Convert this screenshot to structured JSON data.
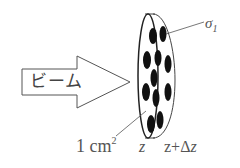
{
  "diagram": {
    "beam_label": "ビーム",
    "cross_section_label": "σ",
    "cross_section_subscript": "1",
    "area_label": "1 cm",
    "area_exponent": "2",
    "z_label": "z",
    "z_plus_label_prefix": "z+Δ",
    "z_plus_label_var": "z",
    "colors": {
      "stroke": "#555555",
      "particle": "#111111",
      "background": "#ffffff"
    }
  }
}
